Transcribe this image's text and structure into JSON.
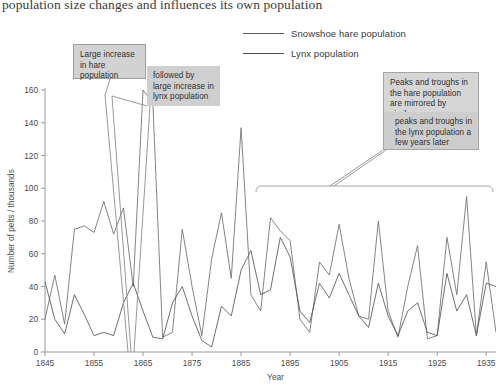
{
  "caption": "population size changes and influences its own population",
  "legend": {
    "position": "top-center",
    "items": [
      {
        "label": "Snowshoe hare population",
        "color": "#6e6e6e",
        "name": "legend-hare"
      },
      {
        "label": "Lynx population",
        "color": "#555555",
        "name": "legend-lynx"
      }
    ]
  },
  "annotations": [
    {
      "id": "hare-increase",
      "text": "Large increase in hare population"
    },
    {
      "id": "lynx-increase",
      "text": "followed by large increase in lynx population"
    },
    {
      "id": "mirror-a",
      "text": "Peaks and troughs in the hare population are mirrored by similar"
    },
    {
      "id": "mirror-b",
      "text": "peaks and troughs in the lynx population a few years later"
    }
  ],
  "axes": {
    "y_title": "Number of pelts / thousands",
    "x_title": "Year",
    "y_ticks": [
      0,
      20,
      40,
      60,
      80,
      100,
      120,
      140,
      160
    ],
    "x_ticks": [
      1845,
      1855,
      1865,
      1875,
      1885,
      1895,
      1905,
      1915,
      1925,
      1935
    ]
  },
  "chart_data": {
    "type": "line",
    "title": "",
    "xlabel": "Year",
    "ylabel": "Number of pelts / thousands",
    "xlim": [
      1845,
      1937
    ],
    "ylim": [
      0,
      165
    ],
    "grid": false,
    "legend_position": "top-center",
    "x": [
      1845,
      1847,
      1849,
      1851,
      1853,
      1855,
      1857,
      1859,
      1861,
      1863,
      1865,
      1867,
      1869,
      1871,
      1873,
      1875,
      1877,
      1879,
      1881,
      1883,
      1885,
      1887,
      1889,
      1891,
      1893,
      1895,
      1897,
      1899,
      1901,
      1903,
      1905,
      1907,
      1909,
      1911,
      1913,
      1915,
      1917,
      1919,
      1921,
      1923,
      1925,
      1927,
      1929,
      1931,
      1933,
      1935,
      1937
    ],
    "series": [
      {
        "name": "Snowshoe hare population",
        "color": "#6e6e6e",
        "values": [
          20,
          47,
          17,
          75,
          77,
          73,
          92,
          72,
          88,
          40,
          160,
          152,
          9,
          12,
          75,
          40,
          10,
          57,
          85,
          45,
          137,
          35,
          25,
          82,
          74,
          68,
          20,
          12,
          55,
          47,
          78,
          45,
          22,
          20,
          80,
          25,
          9,
          40,
          65,
          8,
          10,
          70,
          35,
          95,
          10,
          55,
          12
        ]
      },
      {
        "name": "Lynx population",
        "color": "#555555",
        "values": [
          43,
          20,
          11,
          35,
          23,
          10,
          12,
          10,
          30,
          42,
          25,
          9,
          8,
          30,
          40,
          22,
          7,
          3,
          28,
          22,
          50,
          62,
          35,
          38,
          70,
          58,
          25,
          18,
          42,
          33,
          48,
          35,
          22,
          15,
          42,
          22,
          10,
          25,
          30,
          12,
          10,
          48,
          25,
          35,
          10,
          42,
          40
        ]
      }
    ]
  }
}
